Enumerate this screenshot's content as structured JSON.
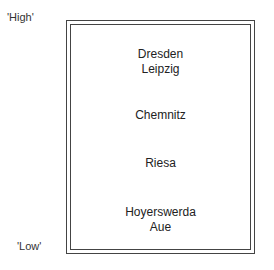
{
  "scale": {
    "high_label": "'High'",
    "low_label": "'Low'"
  },
  "levels": [
    {
      "cities": [
        "Dresden",
        "Leipzig"
      ]
    },
    {
      "cities": [
        "Chemnitz"
      ]
    },
    {
      "cities": [
        "Riesa"
      ]
    },
    {
      "cities": [
        "Hoyerswerda",
        "Aue"
      ]
    }
  ]
}
